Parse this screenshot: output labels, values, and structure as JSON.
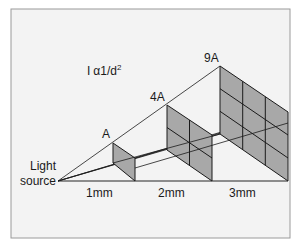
{
  "figure": {
    "formula": {
      "lhs": "I",
      "symbol": "α",
      "rhs": "1/d",
      "exponent": "2"
    },
    "source_label": [
      "Light",
      "source"
    ],
    "panels": [
      {
        "label": "A",
        "grid": 1,
        "distance_label": "1mm"
      },
      {
        "label": "4A",
        "grid": 2,
        "distance_label": "2mm"
      },
      {
        "label": "9A",
        "grid": 3,
        "distance_label": "3mm"
      }
    ],
    "colors": {
      "background": "#f3f3f3",
      "frame": "#9a9a9a",
      "panel_fill": "#a8a8a8",
      "line": "#1a1a1a",
      "baseline": "#6a6a6a"
    }
  }
}
